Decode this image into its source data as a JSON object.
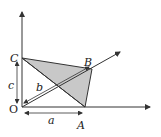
{
  "diagram": {
    "points": {
      "O": {
        "label": "O",
        "x": 22,
        "y": 107
      },
      "A": {
        "label": "A",
        "x": 85,
        "y": 107
      },
      "B": {
        "label": "B",
        "x": 92,
        "y": 69
      },
      "C": {
        "label": "C",
        "x": 22,
        "y": 58
      }
    },
    "lengths": {
      "a": "a",
      "b": "b",
      "c": "c"
    },
    "colors": {
      "stroke": "#333333",
      "fill": "#c8c8c8"
    }
  }
}
